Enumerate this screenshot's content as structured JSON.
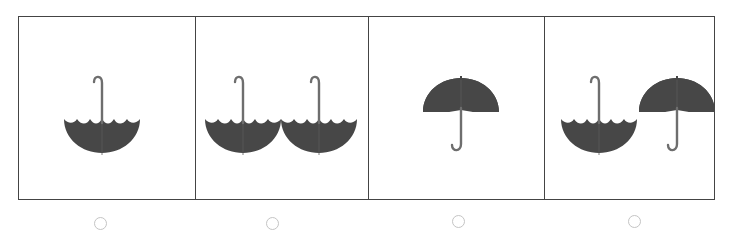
{
  "colors": {
    "umbrella_fill": "#474747",
    "umbrella_handle": "#6e6e6e",
    "frame_border": "#444444",
    "radio_border": "#c4c4c4"
  },
  "options": [
    {
      "id": "A",
      "umbrellas": [
        {
          "orientation": "upside-down"
        }
      ]
    },
    {
      "id": "B",
      "umbrellas": [
        {
          "orientation": "upside-down"
        },
        {
          "orientation": "upside-down"
        }
      ]
    },
    {
      "id": "C",
      "umbrellas": [
        {
          "orientation": "upright"
        }
      ]
    },
    {
      "id": "D",
      "umbrellas": [
        {
          "orientation": "upside-down"
        },
        {
          "orientation": "upright"
        }
      ]
    }
  ],
  "radios": [
    {
      "selected": false
    },
    {
      "selected": false
    },
    {
      "selected": false
    },
    {
      "selected": false
    }
  ]
}
